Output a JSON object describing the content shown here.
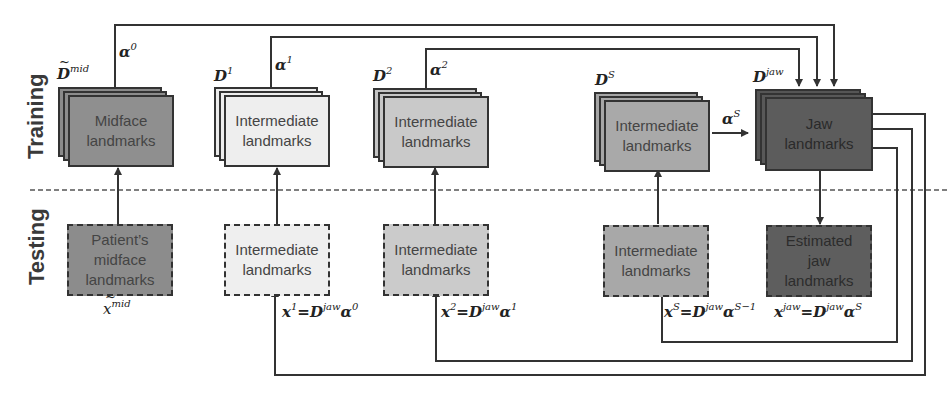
{
  "rows": {
    "training": "Training",
    "testing": "Testing"
  },
  "training_boxes": [
    {
      "id": "midface",
      "line1": "Midface",
      "line2": "landmarks",
      "dict_symbol": "D",
      "dict_sup": "mid",
      "dict_tilde": true,
      "fill": "#8f8f8f",
      "alpha_base": "α",
      "alpha_sup": "0"
    },
    {
      "id": "inter1",
      "line1": "Intermediate",
      "line2": "landmarks",
      "dict_symbol": "D",
      "dict_sup": "1",
      "fill": "#eeeeee",
      "alpha_base": "α",
      "alpha_sup": "1"
    },
    {
      "id": "inter2",
      "line1": "Intermediate",
      "line2": "landmarks",
      "dict_symbol": "D",
      "dict_sup": "2",
      "fill": "#c9c9c9",
      "alpha_base": "α",
      "alpha_sup": "2"
    },
    {
      "id": "interS",
      "line1": "Intermediate",
      "line2": "landmarks",
      "dict_symbol": "D",
      "dict_sup": "S",
      "fill": "#a9a9a9",
      "alpha_base": "α",
      "alpha_sup": "S"
    },
    {
      "id": "jaw",
      "line1": "Jaw",
      "line2": "landmarks",
      "dict_symbol": "D",
      "dict_sup": "jaw",
      "fill": "#5c5c5c"
    }
  ],
  "testing_boxes": [
    {
      "id": "patient",
      "text": "Patient's midface landmarks",
      "lines": [
        "Patient’s",
        "midface",
        "landmarks"
      ],
      "fill": "#8c8c8c",
      "formula": {
        "lhs": "x",
        "lhs_sup": "mid",
        "tilde": true
      }
    },
    {
      "id": "t_inter1",
      "lines": [
        "Intermediate",
        "landmarks"
      ],
      "fill": "#efefef",
      "formula": {
        "lhs": "x",
        "lhs_sup": "1",
        "rhs": "D",
        "rhs_sup": "jaw",
        "alpha": "α",
        "alpha_sup": "0"
      }
    },
    {
      "id": "t_inter2",
      "lines": [
        "Intermediate",
        "landmarks"
      ],
      "fill": "#cbcbcb",
      "formula": {
        "lhs": "x",
        "lhs_sup": "2",
        "rhs": "D",
        "rhs_sup": "jaw",
        "alpha": "α",
        "alpha_sup": "1"
      }
    },
    {
      "id": "t_interS",
      "lines": [
        "Intermediate",
        "landmarks"
      ],
      "fill": "#a8a8a8",
      "formula": {
        "lhs": "x",
        "lhs_sup": "S",
        "rhs": "D",
        "rhs_sup": "jaw",
        "alpha": "α",
        "alpha_sup": "S−1"
      }
    },
    {
      "id": "t_jaw",
      "lines": [
        "Estimated",
        "jaw",
        "landmarks"
      ],
      "fill": "#5e5e5e",
      "formula": {
        "lhs": "x",
        "lhs_sup": "jaw",
        "rhs": "D",
        "rhs_sup": "jaw",
        "alpha": "α",
        "alpha_sup": "S"
      }
    }
  ],
  "equals": "=",
  "colors": {
    "line": "#333333",
    "divider": "#555555",
    "text": "#444444"
  }
}
